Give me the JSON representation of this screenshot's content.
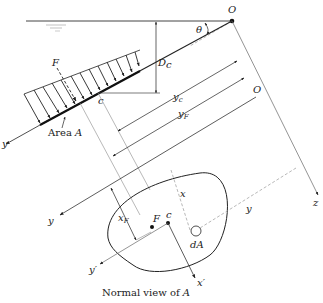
{
  "diagram": {
    "caption_prefix": "Normal view of ",
    "caption_var": "A",
    "labels": {
      "origin_top": "O",
      "origin_side": "O",
      "theta": "θ",
      "depth_centroid": "D",
      "depth_centroid_sub": "c",
      "force": "F",
      "area": "Area ",
      "area_var": "A",
      "centroid_side": "c",
      "yc": "y",
      "yc_sub": "c",
      "yF": "y",
      "yF_sub": "F",
      "y_axis_side": "y",
      "y_axis_lower": "y",
      "z_axis": "z",
      "x_dist": "x",
      "y_dist": "y",
      "xF": "x",
      "xF_sub": "F",
      "force_point": "F",
      "centroid_point": "c",
      "dA": "dA",
      "y_prime": "y′",
      "x_prime": "x′"
    },
    "colors": {
      "line": "#222222",
      "light_line": "#888888",
      "dashed_line": "#999999",
      "water_surface": "#555555"
    }
  }
}
